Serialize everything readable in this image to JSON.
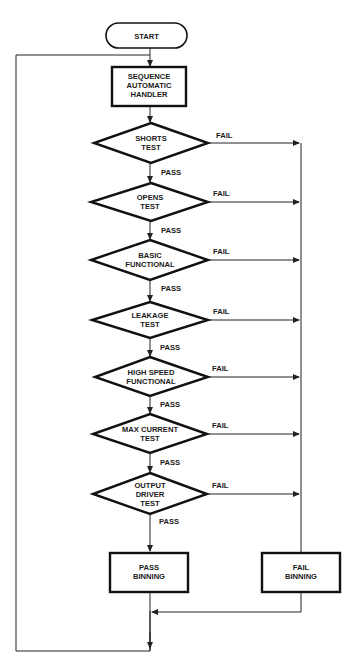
{
  "diagram": {
    "type": "flowchart",
    "colors": {
      "stroke": "#111111",
      "background": "#ffffff",
      "text": "#1a1a1a"
    },
    "start": {
      "label": "START",
      "shape": "terminator"
    },
    "handler": {
      "lines": [
        "SEQUENCE",
        "AUTOMATIC",
        "HANDLER"
      ],
      "shape": "process"
    },
    "tests": [
      {
        "lines": [
          "SHORTS",
          "TEST"
        ],
        "pass_label": "PASS",
        "fail_label": "FAIL"
      },
      {
        "lines": [
          "OPENS",
          "TEST"
        ],
        "pass_label": "PASS",
        "fail_label": "FAIL"
      },
      {
        "lines": [
          "BASIC",
          "FUNCTIONAL"
        ],
        "pass_label": "PASS",
        "fail_label": "FAIL"
      },
      {
        "lines": [
          "LEAKAGE",
          "TEST"
        ],
        "pass_label": "PASS",
        "fail_label": "FAIL"
      },
      {
        "lines": [
          "HIGH SPEED",
          "FUNCTIONAL"
        ],
        "pass_label": "PASS",
        "fail_label": "FAIL"
      },
      {
        "lines": [
          "MAX CURRENT",
          "TEST"
        ],
        "pass_label": "PASS",
        "fail_label": "FAIL"
      },
      {
        "lines": [
          "OUTPUT",
          "DRIVER",
          "TEST"
        ],
        "pass_label": "PASS",
        "fail_label": "FAIL"
      }
    ],
    "pass_binning": {
      "lines": [
        "PASS",
        "BINNING"
      ],
      "shape": "process"
    },
    "fail_binning": {
      "lines": [
        "FAIL",
        "BINNING"
      ],
      "shape": "process"
    },
    "edges": [
      {
        "from": "START",
        "to": "SEQUENCE AUTOMATIC HANDLER"
      },
      {
        "from": "SEQUENCE AUTOMATIC HANDLER",
        "to": "SHORTS TEST"
      },
      {
        "from": "SHORTS TEST",
        "to": "OPENS TEST",
        "label": "PASS"
      },
      {
        "from": "OPENS TEST",
        "to": "BASIC FUNCTIONAL",
        "label": "PASS"
      },
      {
        "from": "BASIC FUNCTIONAL",
        "to": "LEAKAGE TEST",
        "label": "PASS"
      },
      {
        "from": "LEAKAGE TEST",
        "to": "HIGH SPEED FUNCTIONAL",
        "label": "PASS"
      },
      {
        "from": "HIGH SPEED FUNCTIONAL",
        "to": "MAX CURRENT TEST",
        "label": "PASS"
      },
      {
        "from": "MAX CURRENT TEST",
        "to": "OUTPUT DRIVER TEST",
        "label": "PASS"
      },
      {
        "from": "OUTPUT DRIVER TEST",
        "to": "PASS BINNING",
        "label": "PASS"
      },
      {
        "from": "SHORTS TEST",
        "to": "FAIL BINNING",
        "label": "FAIL"
      },
      {
        "from": "OPENS TEST",
        "to": "FAIL BINNING",
        "label": "FAIL"
      },
      {
        "from": "BASIC FUNCTIONAL",
        "to": "FAIL BINNING",
        "label": "FAIL"
      },
      {
        "from": "LEAKAGE TEST",
        "to": "FAIL BINNING",
        "label": "FAIL"
      },
      {
        "from": "HIGH SPEED FUNCTIONAL",
        "to": "FAIL BINNING",
        "label": "FAIL"
      },
      {
        "from": "MAX CURRENT TEST",
        "to": "FAIL BINNING",
        "label": "FAIL"
      },
      {
        "from": "OUTPUT DRIVER TEST",
        "to": "FAIL BINNING",
        "label": "FAIL"
      },
      {
        "from": "FAIL BINNING",
        "to": "merge"
      },
      {
        "from": "PASS BINNING",
        "to": "merge"
      },
      {
        "from": "merge",
        "to": "SEQUENCE AUTOMATIC HANDLER",
        "note": "loop back"
      }
    ]
  }
}
